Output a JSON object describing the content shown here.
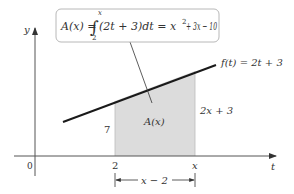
{
  "diagram": {
    "formula_box": {
      "lhs": "A(x) = ",
      "integral_upper": "x",
      "integral_lower": "2",
      "integrand": "(2t + 3)dt = x",
      "power": "2",
      "tail": " + 3x − 10"
    },
    "function_label": "f(t) = 2t + 3",
    "area_label": "A(x)",
    "left_height_label": "7",
    "right_height_label": "2x + 3",
    "axes": {
      "x_axis_label": "t",
      "y_axis_label": "y",
      "origin_label": "0",
      "tick_a_label": "2",
      "tick_b_label": "x"
    },
    "width_label": "x − 2",
    "colors": {
      "shade": "#dcdcdc",
      "line": "#1a1a1a",
      "axis": "#555555",
      "box_border": "#b8b8b8"
    }
  }
}
